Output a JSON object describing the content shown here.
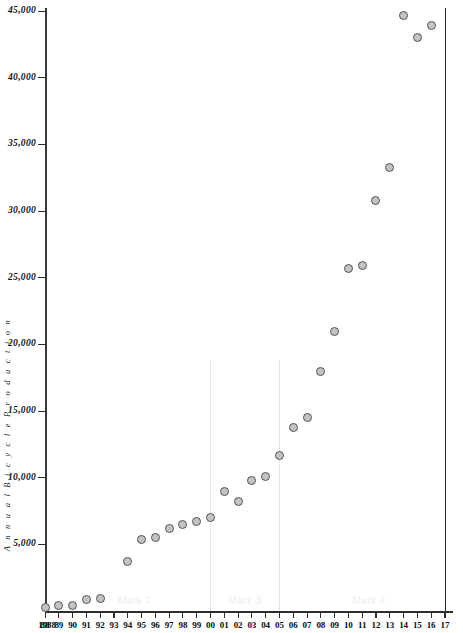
{
  "chart_data": {
    "type": "scatter",
    "title": "",
    "xlabel": "",
    "ylabel": "Annual Bicycle Production",
    "ylabel_spaced": "A n n u a l   B i c y c l e   P r o d u c t i o n",
    "x": [
      1988,
      1989,
      1990,
      1991,
      1992,
      1994,
      1995,
      1996,
      1997,
      1998,
      1999,
      2000,
      2001,
      2002,
      2003,
      2004,
      2005,
      2006,
      2007,
      2008,
      2009,
      2010,
      2011,
      2012,
      2013,
      2014,
      2015,
      2016
    ],
    "values": [
      300,
      400,
      450,
      900,
      950,
      3700,
      5400,
      5500,
      6200,
      6500,
      6700,
      7000,
      9000,
      8200,
      9800,
      10100,
      11700,
      13800,
      14500,
      18000,
      21000,
      25700,
      25900,
      30800,
      33300,
      44700,
      43000,
      43900
    ],
    "ytick_labels": [
      "45,000",
      "40,000",
      "35,000",
      "30,000",
      "25,000",
      "20,000",
      "15,000",
      "10,000",
      "5,000"
    ],
    "ytick_values": [
      45000,
      40000,
      35000,
      30000,
      25000,
      20000,
      15000,
      10000,
      5000
    ],
    "ylim": [
      0,
      45000
    ],
    "xlim": [
      1988,
      2017
    ],
    "xtick_labels": [
      "1988",
      "88",
      "89",
      "90",
      "91",
      "92",
      "93",
      "94",
      "95",
      "96",
      "97",
      "98",
      "99",
      "00",
      "01",
      "02",
      "03",
      "04",
      "05",
      "06",
      "07",
      "08",
      "09",
      "10",
      "11",
      "12",
      "13",
      "14",
      "15",
      "16",
      "17"
    ],
    "grid": false,
    "legend": "none",
    "marker_fill": "#c3c3c3",
    "marker_edge": "#555555",
    "axis_color": "#2e2e2e",
    "annotations": [
      {
        "label": "Mark 2",
        "x": 1994.5
      },
      {
        "label": "Mark 3",
        "x": 2002.5
      },
      {
        "label": "Mark 4",
        "x": 2011.5
      }
    ],
    "dividers": [
      2000,
      2005
    ]
  }
}
